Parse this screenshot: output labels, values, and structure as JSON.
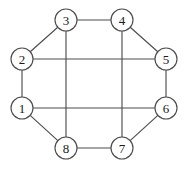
{
  "diagram": {
    "type": "graph",
    "title": "",
    "canvas": {
      "width": 188,
      "height": 172,
      "background": "#ffffff"
    },
    "style": {
      "edge_color": "#4d4d4d",
      "edge_width": 1.15,
      "node_fill": "#ffffff",
      "node_stroke": "#4d4d4d",
      "node_stroke_width": 1.15,
      "label_color": "#1a1a1a",
      "node_radius": 11
    },
    "nodes": [
      {
        "id": "1",
        "label": "1",
        "cx": 22,
        "cy": 108,
        "r": 11
      },
      {
        "id": "2",
        "label": "2",
        "cx": 22,
        "cy": 59,
        "r": 11
      },
      {
        "id": "3",
        "label": "3",
        "cx": 66,
        "cy": 20,
        "r": 11
      },
      {
        "id": "4",
        "label": "4",
        "cx": 122,
        "cy": 20,
        "r": 11
      },
      {
        "id": "5",
        "label": "5",
        "cx": 166,
        "cy": 59,
        "r": 11
      },
      {
        "id": "6",
        "label": "6",
        "cx": 166,
        "cy": 108,
        "r": 11
      },
      {
        "id": "7",
        "label": "7",
        "cx": 122,
        "cy": 148,
        "r": 11
      },
      {
        "id": "8",
        "label": "8",
        "cx": 66,
        "cy": 148,
        "r": 11
      }
    ],
    "edges": [
      {
        "from": "1",
        "to": "2",
        "kind": "cycle"
      },
      {
        "from": "2",
        "to": "3",
        "kind": "cycle"
      },
      {
        "from": "3",
        "to": "4",
        "kind": "cycle"
      },
      {
        "from": "4",
        "to": "5",
        "kind": "cycle"
      },
      {
        "from": "5",
        "to": "6",
        "kind": "cycle"
      },
      {
        "from": "6",
        "to": "7",
        "kind": "cycle"
      },
      {
        "from": "7",
        "to": "8",
        "kind": "cycle"
      },
      {
        "from": "8",
        "to": "1",
        "kind": "cycle"
      },
      {
        "from": "2",
        "to": "5",
        "kind": "chord"
      },
      {
        "from": "1",
        "to": "6",
        "kind": "chord"
      },
      {
        "from": "3",
        "to": "8",
        "kind": "chord"
      },
      {
        "from": "4",
        "to": "7",
        "kind": "chord"
      }
    ]
  }
}
